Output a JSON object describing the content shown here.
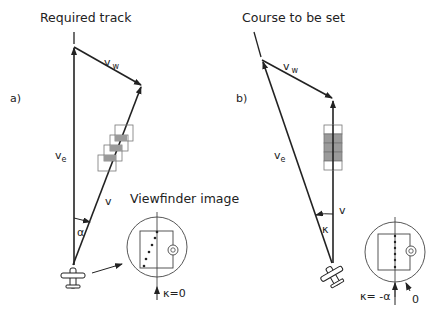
{
  "panel_a": {
    "title": "Required track",
    "label": "a)",
    "ve": "v",
    "ve_sub": "e",
    "vw": "v",
    "vw_sub": "w",
    "v": "v",
    "angle": "α",
    "viewfinder_title": "Viewfinder image",
    "kappa_label": "κ=0"
  },
  "panel_b": {
    "title": "Course to be set",
    "label": "b)",
    "ve": "v",
    "ve_sub": "e",
    "vw": "v",
    "vw_sub": "w",
    "v": "v",
    "angle": "κ",
    "kappa_label": "κ= -α",
    "zero_label": "0"
  },
  "colors": {
    "line": "#222222",
    "fill_gray": "#9a9a9a",
    "frame": "#555555"
  }
}
